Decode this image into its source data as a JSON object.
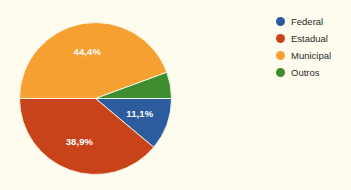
{
  "chart_data": {
    "type": "pie",
    "title": "",
    "categories": [
      "Federal",
      "Estadual",
      "Municipal",
      "Outros"
    ],
    "values": [
      11.1,
      38.9,
      44.4,
      5.6
    ],
    "value_labels": [
      "11,1%",
      "38,9%",
      "44,4%",
      ""
    ],
    "colors": [
      "#2c5c9e",
      "#c9431a",
      "#f5a030",
      "#3d8c2e"
    ],
    "units": "%",
    "legend_position": "right",
    "start_angle_deg": 0,
    "direction": "clockwise",
    "grid": false,
    "background_color": "#fdfcee",
    "label_text_color": "#ffffff",
    "legend_text_color": "#2b2b2b"
  },
  "legend": {
    "items": [
      {
        "label": "Federal",
        "color": "#2c5c9e"
      },
      {
        "label": "Estadual",
        "color": "#c9431a"
      },
      {
        "label": "Municipal",
        "color": "#f5a030"
      },
      {
        "label": "Outros",
        "color": "#3d8c2e"
      }
    ]
  },
  "slices": [
    {
      "label": "11,1%"
    },
    {
      "label": "38,9%"
    },
    {
      "label": "44,4%"
    },
    {
      "label": ""
    }
  ]
}
